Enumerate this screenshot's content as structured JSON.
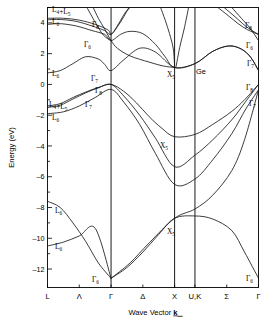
{
  "figure": {
    "material_label": "Ge",
    "y_axis_title": "Energy (eV)",
    "x_axis_title_pre": "Wave Vector ",
    "x_axis_title_sym": "k"
  },
  "chart_data": {
    "type": "line",
    "title": "Ge",
    "xlabel": "Wave Vector k",
    "ylabel": "Energy (eV)",
    "ylim": [
      -13.2,
      5.0
    ],
    "grid": false,
    "legend": "none",
    "x_tick_labels": [
      "L",
      "Λ",
      "Γ",
      "Δ",
      "X",
      "U,K",
      "Σ",
      "Γ"
    ],
    "x_tick_positions": [
      0.0,
      0.5,
      1.0,
      1.5,
      2.0,
      2.32,
      2.82,
      3.32
    ],
    "y_ticks_major": [
      4,
      2,
      0,
      -2,
      -4,
      -6,
      -8,
      -10,
      -12
    ],
    "y_ticks_minor": [
      5,
      3,
      1,
      -1,
      -3,
      -5,
      -7,
      -9,
      -11
    ],
    "symmetry_lines": [
      "Γ",
      "X",
      "U,K"
    ],
    "annotations": [
      {
        "text": "L₄+L₅",
        "energy": 4.2,
        "point": "L"
      },
      {
        "text": "L₆",
        "energy": 3.9,
        "point": "L"
      },
      {
        "text": "L₆",
        "energy": 0.75,
        "point": "L"
      },
      {
        "text": "L₄+L₅",
        "energy": -1.4,
        "point": "L"
      },
      {
        "text": "L₆",
        "energy": -1.85,
        "point": "L"
      },
      {
        "text": "L₆",
        "energy": -7.6,
        "point": "L"
      },
      {
        "text": "L₆",
        "energy": -10.5,
        "point": "L"
      },
      {
        "text": "Γ₈",
        "energy": 3.25,
        "point": "Γ"
      },
      {
        "text": "Γ₆",
        "energy": 2.85,
        "point": "Γ"
      },
      {
        "text": "Γ₇",
        "energy": 0.9,
        "point": "Γ"
      },
      {
        "text": "Γ₈",
        "energy": 0.0,
        "point": "Γ"
      },
      {
        "text": "Γ₇",
        "energy": -0.3,
        "point": "Γ"
      },
      {
        "text": "Γ₆",
        "energy": -12.6,
        "point": "Γ"
      },
      {
        "text": "X₅",
        "energy": 1.1,
        "point": "X"
      },
      {
        "text": "X₅",
        "energy": -3.4,
        "point": "X"
      },
      {
        "text": "X₅",
        "energy": -8.7,
        "point": "X"
      },
      {
        "text": "Γ₈",
        "energy": 3.25,
        "point": "Γ-right"
      },
      {
        "text": "Γ₆",
        "energy": 2.85,
        "point": "Γ-right"
      },
      {
        "text": "Γ₇",
        "energy": 0.9,
        "point": "Γ-right"
      },
      {
        "text": "Γ₈",
        "energy": 0.0,
        "point": "Γ-right"
      },
      {
        "text": "Γ₇",
        "energy": -0.3,
        "point": "Γ-right"
      },
      {
        "text": "Γ₆",
        "energy": -12.6,
        "point": "Γ-right"
      }
    ],
    "series": [
      {
        "name": "valence-band-1-heavy-hole",
        "points": [
          [
            0.0,
            -1.4
          ],
          [
            0.2,
            -1.25
          ],
          [
            0.4,
            -0.85
          ],
          [
            0.6,
            -0.5
          ],
          [
            0.8,
            -0.2
          ],
          [
            1.0,
            0.0
          ],
          [
            1.2,
            -0.45
          ],
          [
            1.4,
            -1.2
          ],
          [
            1.6,
            -2.1
          ],
          [
            1.8,
            -2.85
          ],
          [
            2.0,
            -3.4
          ],
          [
            2.32,
            -3.25
          ],
          [
            2.6,
            -2.6
          ],
          [
            2.9,
            -1.75
          ],
          [
            3.1,
            -1.0
          ],
          [
            3.32,
            0.0
          ]
        ]
      },
      {
        "name": "valence-band-2-light-hole",
        "points": [
          [
            0.0,
            -1.5
          ],
          [
            0.2,
            -1.35
          ],
          [
            0.4,
            -0.95
          ],
          [
            0.6,
            -0.55
          ],
          [
            0.8,
            -0.22
          ],
          [
            1.0,
            0.0
          ],
          [
            1.2,
            -0.75
          ],
          [
            1.45,
            -2.0
          ],
          [
            1.7,
            -3.5
          ],
          [
            2.0,
            -5.35
          ],
          [
            2.32,
            -4.6
          ],
          [
            2.6,
            -3.6
          ],
          [
            2.9,
            -2.3
          ],
          [
            3.12,
            -1.1
          ],
          [
            3.32,
            0.0
          ]
        ]
      },
      {
        "name": "valence-band-3-split-off",
        "points": [
          [
            0.0,
            -1.9
          ],
          [
            0.25,
            -1.78
          ],
          [
            0.5,
            -1.4
          ],
          [
            0.75,
            -0.85
          ],
          [
            1.0,
            -0.32
          ],
          [
            1.2,
            -1.15
          ],
          [
            1.45,
            -2.6
          ],
          [
            1.7,
            -4.5
          ],
          [
            2.0,
            -6.5
          ],
          [
            2.32,
            -6.15
          ],
          [
            2.6,
            -4.9
          ],
          [
            2.9,
            -3.2
          ],
          [
            3.12,
            -1.6
          ],
          [
            3.32,
            -0.35
          ]
        ]
      },
      {
        "name": "valence-band-4-lower-L",
        "points": [
          [
            0.0,
            -7.6
          ],
          [
            0.2,
            -8.0
          ],
          [
            0.4,
            -9.0
          ],
          [
            0.6,
            -10.2
          ],
          [
            0.8,
            -11.6
          ],
          [
            1.0,
            -12.6
          ]
        ]
      },
      {
        "name": "valence-band-4-lower-right",
        "points": [
          [
            1.0,
            -12.6
          ],
          [
            1.25,
            -11.9
          ],
          [
            1.5,
            -10.9
          ],
          [
            1.75,
            -9.75
          ],
          [
            2.0,
            -8.7
          ],
          [
            2.32,
            -8.55
          ],
          [
            2.6,
            -8.75
          ],
          [
            2.9,
            -9.5
          ],
          [
            3.1,
            -10.9
          ],
          [
            3.32,
            -12.6
          ]
        ]
      },
      {
        "name": "valence-band-5-x5-upper",
        "points": [
          [
            0.0,
            -10.5
          ],
          [
            0.25,
            -10.25
          ],
          [
            0.5,
            -9.85
          ],
          [
            0.75,
            -9.35
          ],
          [
            1.0,
            -12.6
          ]
        ]
      },
      {
        "name": "valence-band-5-x5-branch",
        "points": [
          [
            1.0,
            -12.6
          ],
          [
            1.3,
            -11.6
          ],
          [
            1.6,
            -10.3
          ],
          [
            2.0,
            -8.7
          ],
          [
            2.32,
            -8.1
          ],
          [
            2.6,
            -7.2
          ],
          [
            2.9,
            -5.6
          ],
          [
            3.1,
            -3.6
          ],
          [
            3.32,
            -0.35
          ]
        ]
      },
      {
        "name": "conduction-band-1-L6-lowest",
        "points": [
          [
            0.0,
            0.75
          ],
          [
            0.2,
            0.9
          ],
          [
            0.4,
            1.35
          ],
          [
            0.6,
            1.8
          ],
          [
            0.8,
            1.65
          ],
          [
            0.9,
            1.3
          ],
          [
            1.0,
            0.9
          ],
          [
            1.2,
            1.6
          ],
          [
            1.45,
            2.35
          ],
          [
            1.7,
            2.1
          ],
          [
            2.0,
            1.1
          ],
          [
            2.32,
            1.35
          ],
          [
            2.6,
            2.15
          ],
          [
            2.85,
            2.5
          ],
          [
            3.05,
            2.3
          ],
          [
            3.2,
            1.75
          ],
          [
            3.32,
            0.9
          ]
        ]
      },
      {
        "name": "conduction-band-2",
        "points": [
          [
            0.0,
            3.9
          ],
          [
            0.2,
            3.95
          ],
          [
            0.45,
            3.8
          ],
          [
            0.7,
            3.5
          ],
          [
            0.9,
            3.25
          ],
          [
            1.0,
            2.85
          ],
          [
            1.15,
            3.25
          ],
          [
            1.3,
            3.45
          ],
          [
            1.5,
            3.3
          ],
          [
            1.7,
            2.6
          ],
          [
            1.85,
            1.8
          ],
          [
            2.0,
            1.1
          ],
          [
            2.32,
            1.35
          ],
          [
            2.6,
            2.15
          ],
          [
            2.85,
            2.5
          ],
          [
            3.05,
            2.3
          ],
          [
            3.2,
            1.75
          ],
          [
            3.32,
            0.9
          ]
        ]
      },
      {
        "name": "conduction-band-3-upper",
        "points": [
          [
            0.0,
            4.2
          ],
          [
            0.2,
            4.22
          ],
          [
            0.45,
            4.1
          ],
          [
            0.7,
            3.8
          ],
          [
            0.9,
            3.5
          ],
          [
            1.0,
            3.25
          ],
          [
            1.12,
            3.95
          ],
          [
            1.22,
            4.65
          ],
          [
            1.3,
            5.0
          ]
        ]
      },
      {
        "name": "conduction-band-4-upper",
        "points": [
          [
            0.0,
            4.3
          ],
          [
            0.25,
            4.3
          ],
          [
            0.5,
            4.18
          ],
          [
            0.75,
            3.9
          ],
          [
            0.95,
            3.55
          ],
          [
            1.0,
            3.25
          ],
          [
            1.1,
            3.75
          ],
          [
            1.2,
            4.4
          ],
          [
            1.28,
            5.0
          ]
        ]
      },
      {
        "name": "conduction-band-5-steep-gamma",
        "points": [
          [
            0.72,
            5.0
          ],
          [
            0.8,
            4.3
          ],
          [
            0.9,
            3.6
          ],
          [
            1.0,
            2.85
          ],
          [
            1.1,
            2.35
          ],
          [
            1.3,
            1.85
          ],
          [
            1.6,
            1.45
          ],
          [
            1.82,
            1.2
          ],
          [
            2.0,
            1.1
          ]
        ]
      },
      {
        "name": "conduction-band-6-steep-left",
        "points": [
          [
            0.62,
            5.0
          ],
          [
            0.75,
            4.05
          ],
          [
            0.88,
            3.2
          ],
          [
            1.0,
            2.85
          ]
        ]
      },
      {
        "name": "conduction-band-7-x-rise",
        "points": [
          [
            1.78,
            5.0
          ],
          [
            1.85,
            4.2
          ],
          [
            1.92,
            3.3
          ],
          [
            1.98,
            2.3
          ],
          [
            2.0,
            1.1
          ]
        ]
      },
      {
        "name": "conduction-band-8-x-rise2",
        "points": [
          [
            2.02,
            1.1
          ],
          [
            2.08,
            2.4
          ],
          [
            2.15,
            3.6
          ],
          [
            2.22,
            5.0
          ]
        ]
      },
      {
        "name": "conduction-band-9-right-gamma",
        "points": [
          [
            2.68,
            5.0
          ],
          [
            2.85,
            4.45
          ],
          [
            3.0,
            3.95
          ],
          [
            3.15,
            3.55
          ],
          [
            3.32,
            3.25
          ]
        ]
      },
      {
        "name": "conduction-band-10-right-gamma2",
        "points": [
          [
            2.78,
            5.0
          ],
          [
            2.95,
            4.4
          ],
          [
            3.1,
            3.85
          ],
          [
            3.22,
            3.5
          ],
          [
            3.32,
            3.25
          ]
        ]
      },
      {
        "name": "conduction-band-11-right-gamma3",
        "points": [
          [
            2.9,
            5.0
          ],
          [
            3.05,
            4.3
          ],
          [
            3.18,
            3.7
          ],
          [
            3.32,
            2.85
          ]
        ]
      }
    ]
  }
}
